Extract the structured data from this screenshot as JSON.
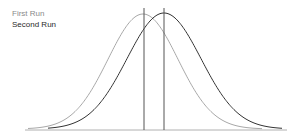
{
  "legend": {
    "items": [
      {
        "label": "First Run",
        "color": "#a0a0a0"
      },
      {
        "label": "Second Run",
        "color": "#333333"
      }
    ]
  },
  "chart_data": {
    "type": "line",
    "title": "",
    "xlabel": "",
    "ylabel": "",
    "grid": false,
    "legend_position": "top-left",
    "series": [
      {
        "name": "First Run",
        "distribution": "normal",
        "peak_x_px": 143,
        "mean_marker": true,
        "color": "#a0a0a0"
      },
      {
        "name": "Second Run",
        "distribution": "normal",
        "peak_x_px": 164,
        "mean_marker": true,
        "color": "#333333"
      }
    ]
  }
}
